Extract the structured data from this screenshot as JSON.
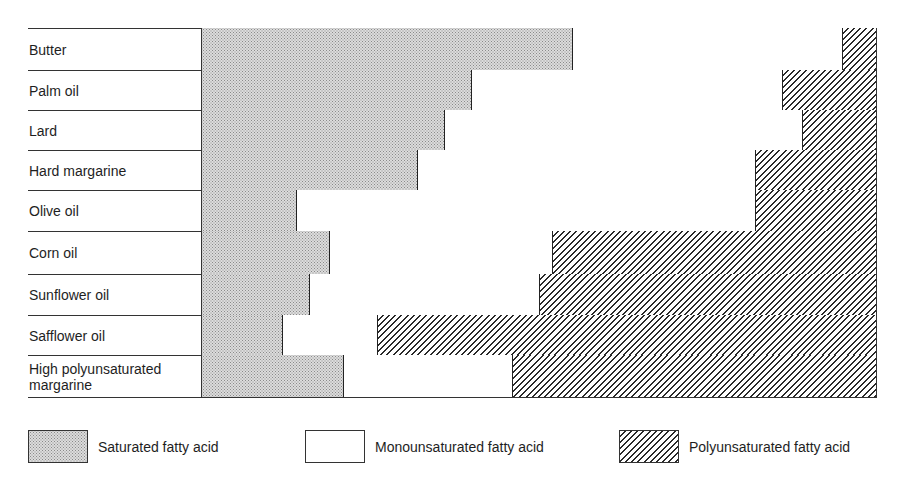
{
  "chart_data": {
    "type": "bar",
    "orientation": "horizontal",
    "stacked": true,
    "normalized_percent": true,
    "title": "",
    "xlabel": "",
    "ylabel": "",
    "xlim": [
      0,
      100
    ],
    "grid": false,
    "legend_position": "bottom",
    "categories": [
      "Butter",
      "Palm oil",
      "Lard",
      "Hard margarine",
      "Olive oil",
      "Corn oil",
      "Sunflower oil",
      "Safflower oil",
      "High polyunsaturated margarine"
    ],
    "series": [
      {
        "name": "Saturated fatty acid",
        "pattern": "dotted",
        "values": [
          55,
          40,
          36,
          32,
          14,
          19,
          16,
          12,
          21
        ]
      },
      {
        "name": "Monounsaturated fatty acid",
        "pattern": "blank",
        "values": [
          40,
          46,
          53,
          50,
          68,
          33,
          34,
          14,
          25
        ]
      },
      {
        "name": "Polyunsaturated fatty acid",
        "pattern": "hatched",
        "values": [
          5,
          14,
          11,
          18,
          18,
          48,
          50,
          74,
          54
        ]
      }
    ]
  },
  "rows": [
    {
      "label": "Butter"
    },
    {
      "label": "Palm oil"
    },
    {
      "label": "Lard"
    },
    {
      "label": "Hard margarine"
    },
    {
      "label": "Olive oil"
    },
    {
      "label": "Corn oil"
    },
    {
      "label": "Sunflower oil"
    },
    {
      "label": "Safflower oil"
    },
    {
      "label": "High polyunsaturated margarine"
    }
  ],
  "legend": {
    "saturated": "Saturated fatty acid",
    "monounsaturated": "Monounsaturated fatty acid",
    "polyunsaturated": "Polyunsaturated fatty acid"
  }
}
